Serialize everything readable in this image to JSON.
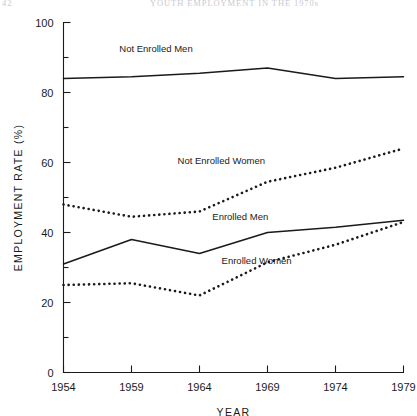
{
  "running_head": {
    "folio": "42",
    "title": "YOUTH EMPLOYMENT IN THE 1970s"
  },
  "chart_data": {
    "type": "line",
    "title": "",
    "xlabel": "YEAR",
    "ylabel": "EMPLOYMENT RATE (%)",
    "xlim": [
      1954,
      1979
    ],
    "ylim": [
      0,
      100
    ],
    "xticks": [
      1954,
      1959,
      1964,
      1969,
      1974,
      1979
    ],
    "xtick_labels": [
      "1954",
      "1959",
      "1964",
      "1969",
      "1974",
      "1979"
    ],
    "yticks": [
      0,
      20,
      40,
      60,
      80,
      100
    ],
    "ytick_labels": [
      "0",
      "20",
      "40",
      "60",
      "80",
      "100"
    ],
    "yminorticks": [
      10,
      30,
      50,
      70,
      90
    ],
    "grid": false,
    "legend_position": "inline-annotations",
    "x": [
      1954,
      1959,
      1964,
      1969,
      1974,
      1979
    ],
    "series": [
      {
        "name": "Not Enrolled Men",
        "style": "solid",
        "values": [
          84,
          84.5,
          85.5,
          87,
          84,
          84.5
        ],
        "label": "Not Enrolled Men",
        "label_x": 1960.8,
        "label_y": 91.5
      },
      {
        "name": "Not Enrolled Women",
        "style": "dotted",
        "values": [
          48,
          44.5,
          46,
          54.5,
          58.5,
          64
        ],
        "label": "Not Enrolled Women",
        "label_x": 1965.6,
        "label_y": 59.5
      },
      {
        "name": "Enrolled Men",
        "style": "solid",
        "values": [
          31,
          38,
          34,
          40,
          41.5,
          43.5
        ],
        "label": "Enrolled Men",
        "label_x": 1967.0,
        "label_y": 43.5
      },
      {
        "name": "Enrolled Women",
        "style": "dotted",
        "values": [
          25,
          25.5,
          22,
          31.5,
          36.5,
          43
        ],
        "label": "Enrolled Women",
        "label_x": 1968.2,
        "label_y": 31.0
      }
    ]
  }
}
